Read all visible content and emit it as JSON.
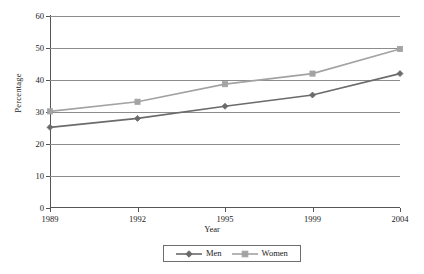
{
  "chart_data": {
    "type": "line",
    "title": "",
    "xlabel": "Year",
    "ylabel": "Percentage",
    "categories": [
      "1989",
      "1992",
      "1995",
      "1999",
      "2004"
    ],
    "x": [
      1989,
      1992,
      1995,
      1999,
      2004
    ],
    "series": [
      {
        "name": "Men",
        "values": [
          25.2,
          28.0,
          31.8,
          35.3,
          42.0
        ],
        "color": "#6b6b6b",
        "marker": "diamond"
      },
      {
        "name": "Women",
        "values": [
          30.2,
          33.2,
          38.7,
          42.0,
          49.7
        ],
        "color": "#a3a3a3",
        "marker": "square"
      }
    ],
    "ylim": [
      0,
      60
    ],
    "yticks": [
      0,
      10,
      20,
      30,
      40,
      50,
      60
    ],
    "ytick_labels": [
      "0",
      "10",
      "20",
      "30",
      "40",
      "50",
      "60"
    ],
    "grid": true,
    "grid_axis": "y",
    "legend_position": "bottom-center"
  },
  "legend": {
    "entries": [
      {
        "label": "Men"
      },
      {
        "label": "Women"
      }
    ]
  },
  "axes": {
    "x_title": "Year",
    "y_title": "Percentage"
  }
}
